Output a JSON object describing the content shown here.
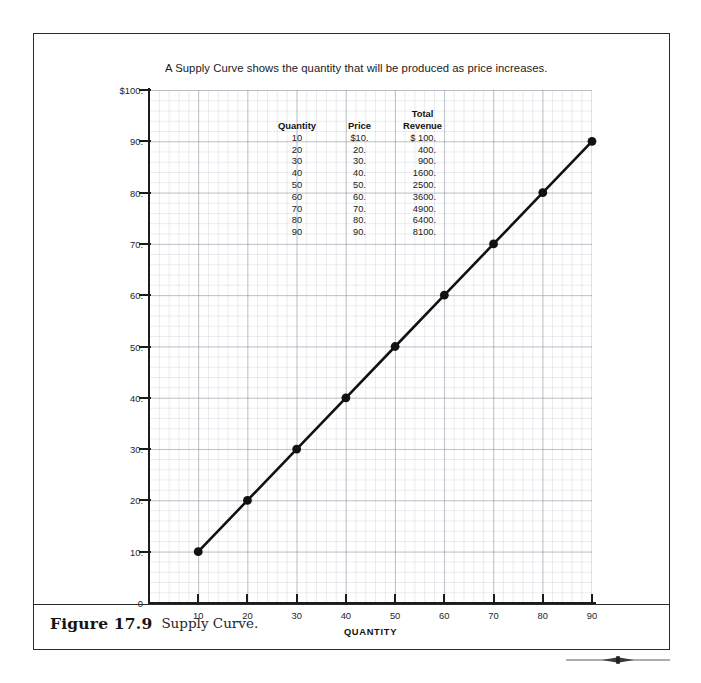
{
  "figure": {
    "number_label": "Figure 17.9",
    "caption": "Supply Curve."
  },
  "chart_data": {
    "type": "line",
    "title": "A Supply Curve shows the quantity that will be produced as price increases.",
    "xlabel": "QUANTITY",
    "ylabel": "",
    "xlim": [
      0,
      90
    ],
    "ylim": [
      0,
      100
    ],
    "grid": true,
    "legend": "none",
    "x": [
      10,
      20,
      30,
      40,
      50,
      60,
      70,
      80,
      90
    ],
    "series": [
      {
        "name": "Supply Curve",
        "values": [
          10,
          20,
          30,
          40,
          50,
          60,
          70,
          80,
          90
        ]
      }
    ],
    "x_ticks": [
      "10",
      "20",
      "30",
      "40",
      "50",
      "60",
      "70",
      "80",
      "90"
    ],
    "y_ticks": [
      "0",
      "10.",
      "20.",
      "30.",
      "40.",
      "50.",
      "60.",
      "70.",
      "80.",
      "90.",
      "$100."
    ],
    "marker": "filled-circle",
    "line_color": "#111111"
  },
  "table": {
    "headers": [
      "Quantity",
      "Price",
      "Total\nRevenue"
    ],
    "rows": [
      {
        "quantity": "10",
        "price": "$10.",
        "revenue": "$  100."
      },
      {
        "quantity": "20",
        "price": "20.",
        "revenue": "400."
      },
      {
        "quantity": "30",
        "price": "30.",
        "revenue": "900."
      },
      {
        "quantity": "40",
        "price": "40.",
        "revenue": "1600."
      },
      {
        "quantity": "50",
        "price": "50.",
        "revenue": "2500."
      },
      {
        "quantity": "60",
        "price": "60.",
        "revenue": "3600."
      },
      {
        "quantity": "70",
        "price": "70.",
        "revenue": "4900."
      },
      {
        "quantity": "80",
        "price": "80.",
        "revenue": "6400."
      },
      {
        "quantity": "90",
        "price": "90.",
        "revenue": "8100."
      }
    ]
  }
}
